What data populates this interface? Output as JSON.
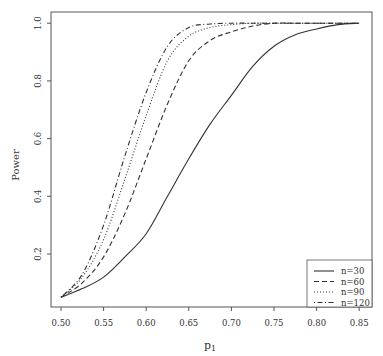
{
  "chart_data": {
    "type": "line",
    "title": "",
    "xlabel": "p1",
    "ylabel": "Power",
    "xlim": [
      0.5,
      0.85
    ],
    "ylim": [
      0.05,
      1.0
    ],
    "x_ticks": [
      "0.50",
      "0.55",
      "0.60",
      "0.65",
      "0.70",
      "0.75",
      "0.80",
      "0.85"
    ],
    "y_ticks": [
      "0.2",
      "0.4",
      "0.6",
      "0.8",
      "1.0"
    ],
    "grid": false,
    "legend_position": "bottom-right",
    "x": [
      0.5,
      0.525,
      0.55,
      0.575,
      0.6,
      0.625,
      0.65,
      0.675,
      0.7,
      0.725,
      0.75,
      0.775,
      0.8,
      0.825,
      0.85
    ],
    "series": [
      {
        "name": "n=30",
        "style": "solid",
        "values": [
          0.05,
          0.08,
          0.12,
          0.19,
          0.27,
          0.4,
          0.53,
          0.65,
          0.75,
          0.85,
          0.92,
          0.96,
          0.98,
          0.995,
          1.0
        ]
      },
      {
        "name": "n=60",
        "style": "dashed",
        "values": [
          0.05,
          0.1,
          0.19,
          0.34,
          0.53,
          0.72,
          0.87,
          0.94,
          0.97,
          0.99,
          1.0,
          1.0,
          1.0,
          1.0,
          1.0
        ]
      },
      {
        "name": "n=90",
        "style": "dotted",
        "values": [
          0.05,
          0.12,
          0.25,
          0.46,
          0.68,
          0.87,
          0.955,
          0.985,
          0.995,
          1.0,
          1.0,
          1.0,
          1.0,
          1.0,
          1.0
        ]
      },
      {
        "name": "n=120",
        "style": "dashdot",
        "values": [
          0.05,
          0.13,
          0.3,
          0.54,
          0.76,
          0.92,
          0.985,
          0.997,
          1.0,
          1.0,
          1.0,
          1.0,
          1.0,
          1.0,
          1.0
        ]
      }
    ]
  },
  "legend": {
    "items": [
      {
        "label": "n=30"
      },
      {
        "label": "n=60"
      },
      {
        "label": "n=90"
      },
      {
        "label": "n=120"
      }
    ]
  },
  "axes": {
    "xlabel_main": "p",
    "xlabel_sub": "1",
    "ylabel": "Power"
  }
}
